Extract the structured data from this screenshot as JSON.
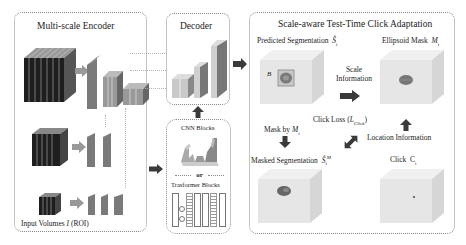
{
  "encoder": {
    "title": "Multi-scale Encoder",
    "input_label_prefix": "Input Volumes ",
    "input_label_var": "I",
    "input_label_suffix": " (ROI)"
  },
  "decoder": {
    "title": "Decoder"
  },
  "blocks": {
    "cnn_title": "CNN Blocks",
    "or_label": "or",
    "transformer_title": "Trasformer Blocks"
  },
  "adaptation": {
    "title": "Scale-aware Test-Time Click Adaptation",
    "predicted_label": "Predicted Segmentation",
    "predicted_var": "Ŝ",
    "predicted_sub": "i",
    "ellipsoid_label": "Ellipsoid Mask",
    "ellipsoid_var": "M",
    "ellipsoid_sub": "i",
    "scale_info": "Scale",
    "scale_info2": "Information",
    "box_label": "B",
    "click_loss_prefix": "Click Loss  (",
    "click_loss_var": "L",
    "click_loss_sub": "Click",
    "click_loss_suffix": ")",
    "mask_by_prefix": "Mask by ",
    "mask_by_var": "M",
    "mask_by_sub": "i",
    "location_info": "Location Information",
    "masked_label": "Masked Segmentation",
    "masked_var": "Ŝ",
    "masked_sub": "i",
    "masked_sup": "M",
    "click_label": "Click",
    "click_var": "C",
    "click_sub": "i"
  },
  "colors": {
    "slab_fill": "#8c8c8c",
    "cube_fill": "#e6e6e6",
    "arrow": "#3a3a3a",
    "border": "#8a8a8a"
  }
}
